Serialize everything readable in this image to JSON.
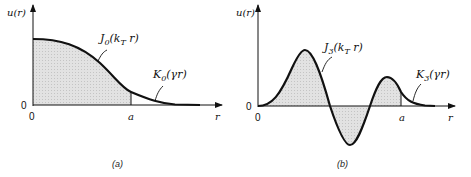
{
  "panels": [
    {
      "id": "a",
      "caption": "(a)",
      "y_axis_label": "u(r)",
      "x_axis_label": "r",
      "origin_y_label": "0",
      "origin_x_label": "0",
      "boundary_label": "a",
      "inner_curve": {
        "label_main": "J",
        "label_sub": "0",
        "label_arg_open": "(k",
        "label_arg_sub": "T",
        "label_arg_close": " r)"
      },
      "outer_curve": {
        "label_main": "K",
        "label_sub": "0",
        "label_arg": "(γr)"
      }
    },
    {
      "id": "b",
      "caption": "(b)",
      "y_axis_label": "u(r)",
      "x_axis_label": "r",
      "origin_y_label": "0",
      "origin_x_label": "0",
      "boundary_label": "a",
      "inner_curve": {
        "label_main": "J",
        "label_sub": "3",
        "label_arg_open": "(k",
        "label_arg_sub": "T",
        "label_arg_close": " r)"
      },
      "outer_curve": {
        "label_main": "K",
        "label_sub": "3",
        "label_arg": "(γr)"
      }
    }
  ],
  "colors": {
    "line": "#111111",
    "fill": "#d9d9d9"
  }
}
